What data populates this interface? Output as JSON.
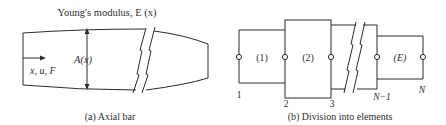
{
  "panel_a": {
    "title": "Young's modulus, E (x)",
    "area_label": "A(x)",
    "axis_label": "x, u, F",
    "caption": "(a)  Axial bar"
  },
  "panel_b": {
    "elements": [
      "(1)",
      "(2)",
      "(E)"
    ],
    "nodes": [
      "1",
      "2",
      "3",
      "N−1",
      "N"
    ],
    "caption": "(b)  Division into elements"
  },
  "colors": {
    "line": "#2a2a2a",
    "text": "#2e2e2e",
    "background": "#ffffff"
  }
}
